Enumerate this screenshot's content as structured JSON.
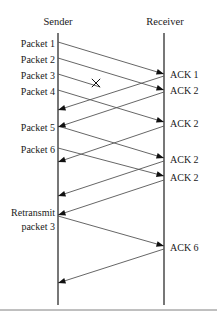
{
  "diagram": {
    "title_sender": "Sender",
    "title_receiver": "Receiver",
    "colors": {
      "line": "#555555",
      "arrow": "#111111",
      "text": "#1a1a1a",
      "border": "#808080",
      "background": "#ffffff"
    },
    "timelines": [
      {
        "name": "sender",
        "label": "Sender",
        "x": 58,
        "y_top": 33,
        "y_bottom": 305
      },
      {
        "name": "receiver",
        "label": "Receiver",
        "x": 164,
        "y_top": 33,
        "y_bottom": 305
      }
    ],
    "sender_labels": [
      {
        "text": "Packet 1",
        "y": 44
      },
      {
        "text": "Packet 2",
        "y": 60
      },
      {
        "text": "Packet 3",
        "y": 76
      },
      {
        "text": "Packet 4",
        "y": 92
      },
      {
        "text": "Packet 5",
        "y": 128
      },
      {
        "text": "Packet 6",
        "y": 150
      },
      {
        "text": "Retransmit",
        "y": 213
      },
      {
        "text": "packet 3",
        "y": 227
      }
    ],
    "receiver_labels": [
      {
        "text": "ACK 1",
        "y": 75
      },
      {
        "text": "ACK 2",
        "y": 91
      },
      {
        "text": "ACK 2",
        "y": 124
      },
      {
        "text": "ACK 2",
        "y": 160
      },
      {
        "text": "ACK 2",
        "y": 178
      },
      {
        "text": "ACK 6",
        "y": 248
      }
    ],
    "lost_marker": {
      "symbol": "x",
      "x": 96,
      "y": 83,
      "meaning": "packet-lost"
    },
    "messages": [
      {
        "name": "packet-1",
        "dir": "to-receiver",
        "x1": 58,
        "y1": 42,
        "x2": 164,
        "y2": 74,
        "arrowhead": true
      },
      {
        "name": "packet-2",
        "dir": "to-receiver",
        "x1": 58,
        "y1": 58,
        "x2": 164,
        "y2": 90,
        "arrowhead": true
      },
      {
        "name": "packet-3-lost",
        "dir": "to-receiver",
        "x1": 58,
        "y1": 74,
        "x2": 100,
        "y2": 87,
        "arrowhead": false
      },
      {
        "name": "packet-4",
        "dir": "to-receiver",
        "x1": 58,
        "y1": 90,
        "x2": 164,
        "y2": 122,
        "arrowhead": true
      },
      {
        "name": "packet-5",
        "dir": "to-receiver",
        "x1": 58,
        "y1": 126,
        "x2": 164,
        "y2": 158,
        "arrowhead": true
      },
      {
        "name": "packet-6",
        "dir": "to-receiver",
        "x1": 58,
        "y1": 148,
        "x2": 164,
        "y2": 176,
        "arrowhead": true
      },
      {
        "name": "retransmit-packet-3",
        "dir": "to-receiver",
        "x1": 58,
        "y1": 216,
        "x2": 164,
        "y2": 246,
        "arrowhead": true
      },
      {
        "name": "ack-1",
        "dir": "to-sender",
        "x1": 164,
        "y1": 76,
        "x2": 58,
        "y2": 110,
        "arrowhead": true
      },
      {
        "name": "ack-2-a",
        "dir": "to-sender",
        "x1": 164,
        "y1": 92,
        "x2": 58,
        "y2": 127,
        "arrowhead": true
      },
      {
        "name": "ack-2-b",
        "dir": "to-sender",
        "x1": 164,
        "y1": 126,
        "x2": 58,
        "y2": 162,
        "arrowhead": true
      },
      {
        "name": "ack-2-c",
        "dir": "to-sender",
        "x1": 164,
        "y1": 161,
        "x2": 58,
        "y2": 196,
        "arrowhead": true
      },
      {
        "name": "ack-2-d",
        "dir": "to-sender",
        "x1": 164,
        "y1": 180,
        "x2": 58,
        "y2": 215,
        "arrowhead": true
      },
      {
        "name": "ack-6",
        "dir": "to-sender",
        "x1": 164,
        "y1": 249,
        "x2": 58,
        "y2": 283,
        "arrowhead": true
      }
    ],
    "bottom_border": {
      "y": 310
    }
  }
}
